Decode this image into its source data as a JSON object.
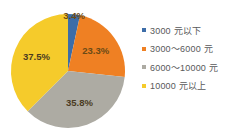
{
  "chart_data": {
    "type": "pie",
    "title": "",
    "categories": [
      "3000 元以下",
      "3000～6000 元",
      "6000～10000 元",
      "10000 元以上"
    ],
    "values": [
      3.4,
      23.3,
      35.8,
      37.5
    ],
    "value_labels": [
      "3.4%",
      "23.3%",
      "35.8%",
      "37.5%"
    ],
    "colors": [
      "#3d6da8",
      "#ef8023",
      "#adaba3",
      "#f5cb2b"
    ],
    "legend_position": "right",
    "grid": false,
    "start_angle_deg": 0,
    "direction": "clockwise",
    "units": "%"
  },
  "legend": {
    "items": [
      {
        "label": "3000 元以下",
        "color": "#3d6da8",
        "marker": "square-marker-icon"
      },
      {
        "label": "3000～6000 元",
        "color": "#ef8023",
        "marker": "square-marker-icon"
      },
      {
        "label": "6000～10000 元",
        "color": "#adaba3",
        "marker": "square-marker-icon"
      },
      {
        "label": "10000 元以上",
        "color": "#f5cb2b",
        "marker": "square-marker-icon"
      }
    ]
  },
  "slices": [
    {
      "label": "3.4%",
      "color": "#3d6da8"
    },
    {
      "label": "23.3%",
      "color": "#ef8023"
    },
    {
      "label": "35.8%",
      "color": "#adaba3"
    },
    {
      "label": "37.5%",
      "color": "#f5cb2b"
    }
  ]
}
